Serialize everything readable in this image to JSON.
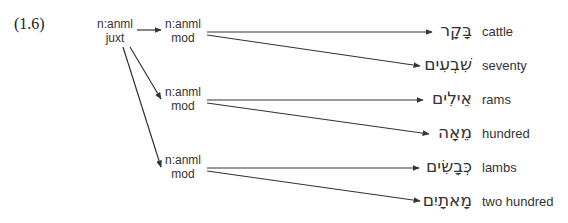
{
  "example_number": "(1.6)",
  "root": {
    "line1": "n:anml",
    "line2": "juxt"
  },
  "mods": [
    {
      "line1": "n:anml",
      "line2": "mod"
    },
    {
      "line1": "n:anml",
      "line2": "mod"
    },
    {
      "line1": "n:anml",
      "line2": "mod"
    }
  ],
  "leaves": [
    {
      "hebrew": "בָּקָר",
      "gloss": "cattle"
    },
    {
      "hebrew": "שִׁבְעִים",
      "gloss": "seventy"
    },
    {
      "hebrew": "אֵילִים",
      "gloss": "rams"
    },
    {
      "hebrew": "מֵאָה",
      "gloss": "hundred"
    },
    {
      "hebrew": "כְּבָשִׂים",
      "gloss": "lambs"
    },
    {
      "hebrew": "מָאתָיִם",
      "gloss": "two hundred"
    }
  ],
  "colors": {
    "line": "#333333",
    "text": "#333333"
  }
}
